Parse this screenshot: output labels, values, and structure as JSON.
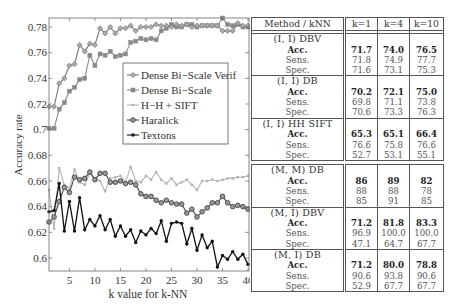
{
  "chart_data": {
    "type": "line",
    "title": "",
    "xlabel": "k value for k-NN",
    "ylabel": "Accuracy rate",
    "xlim": [
      1,
      40
    ],
    "ylim": [
      0.594,
      0.786
    ],
    "xticks": [
      5,
      10,
      15,
      20,
      25,
      30,
      35,
      40
    ],
    "yticks": [
      0.6,
      0.62,
      0.64,
      0.66,
      0.68,
      0.7,
      0.72,
      0.74,
      0.76,
      0.78
    ],
    "ytick_labels": [
      "0.6",
      "0.62",
      "0.64",
      "0.66",
      "0.68",
      "0.7",
      "0.72",
      "0.74",
      "0.76",
      "0.78"
    ],
    "grid": false,
    "legend_position": "inside, upper-middle",
    "x": [
      1,
      2,
      3,
      4,
      5,
      6,
      7,
      8,
      9,
      10,
      11,
      12,
      13,
      14,
      15,
      16,
      17,
      18,
      19,
      20,
      21,
      22,
      23,
      24,
      25,
      26,
      27,
      28,
      29,
      30,
      31,
      32,
      33,
      34,
      35,
      36,
      37,
      38,
      39,
      40
    ],
    "series": [
      {
        "name": "Dense Bi-Scale Verif",
        "color": "#777777",
        "marker": "diamond",
        "values": [
          0.718,
          0.718,
          0.736,
          0.74,
          0.75,
          0.751,
          0.766,
          0.761,
          0.767,
          0.766,
          0.779,
          0.775,
          0.78,
          0.775,
          0.779,
          0.779,
          0.781,
          0.777,
          0.78,
          0.78,
          0.78,
          0.782,
          0.781,
          0.781,
          0.78,
          0.782,
          0.781,
          0.782,
          0.78,
          0.781,
          0.781,
          0.781,
          0.781,
          0.781,
          0.777,
          0.777,
          0.777,
          0.783,
          0.781,
          0.781
        ]
      },
      {
        "name": "Dense Bi-Scale",
        "color": "#8a8a8a",
        "marker": "square",
        "values": [
          0.701,
          0.701,
          0.716,
          0.721,
          0.73,
          0.733,
          0.739,
          0.74,
          0.758,
          0.75,
          0.759,
          0.758,
          0.761,
          0.757,
          0.758,
          0.759,
          0.768,
          0.769,
          0.771,
          0.77,
          0.771,
          0.77,
          0.777,
          0.779,
          0.782,
          0.78,
          0.78,
          0.782,
          0.782,
          0.78,
          0.781,
          0.781,
          0.781,
          0.781,
          0.787,
          0.782,
          0.781,
          0.782,
          0.78,
          0.78
        ]
      },
      {
        "name": "H-H + SIFT",
        "color": "#b3b3b3",
        "marker": "small-square",
        "values": [
          0.653,
          0.623,
          0.67,
          0.657,
          0.654,
          0.669,
          0.659,
          0.657,
          0.666,
          0.662,
          0.66,
          0.652,
          0.662,
          0.663,
          0.664,
          0.659,
          0.671,
          0.66,
          0.659,
          0.664,
          0.661,
          0.667,
          0.661,
          0.658,
          0.662,
          0.657,
          0.659,
          0.661,
          0.657,
          0.653,
          0.66,
          0.66,
          0.661,
          0.66,
          0.661,
          0.662,
          0.662,
          0.663,
          0.663,
          0.664
        ]
      },
      {
        "name": "Haralick",
        "color": "#444444",
        "marker": "circle",
        "values": [
          0.628,
          0.632,
          0.644,
          0.655,
          0.651,
          0.663,
          0.661,
          0.662,
          0.667,
          0.661,
          0.666,
          0.666,
          0.659,
          0.659,
          0.66,
          0.658,
          0.659,
          0.657,
          0.65,
          0.648,
          0.648,
          0.645,
          0.643,
          0.645,
          0.643,
          0.642,
          0.642,
          0.635,
          0.638,
          0.632,
          0.636,
          0.639,
          0.643,
          0.643,
          0.648,
          0.643,
          0.64,
          0.641,
          0.64,
          0.638
        ]
      },
      {
        "name": "Textons",
        "color": "#111111",
        "marker": "dot",
        "values": [
          0.636,
          0.637,
          0.658,
          0.621,
          0.644,
          0.621,
          0.647,
          0.622,
          0.63,
          0.625,
          0.633,
          0.622,
          0.63,
          0.617,
          0.625,
          0.617,
          0.622,
          0.612,
          0.621,
          0.618,
          0.623,
          0.619,
          0.629,
          0.613,
          0.627,
          0.628,
          0.627,
          0.611,
          0.623,
          0.606,
          0.618,
          0.608,
          0.613,
          0.593,
          0.602,
          0.599,
          0.605,
          0.599,
          0.603,
          0.595
        ]
      }
    ]
  },
  "table": {
    "headers": [
      "Method / kNN",
      "k=1",
      "k=4",
      "k=10"
    ],
    "blocks": [
      {
        "groups": [
          {
            "title": "(I, I) DBV",
            "rows": [
              {
                "label": "Acc.",
                "values": [
                  "71.7",
                  "74.0",
                  "76.5"
                ]
              },
              {
                "label": "Sens.",
                "values": [
                  "71.8",
                  "74.9",
                  "77.7"
                ]
              },
              {
                "label": "Spec.",
                "values": [
                  "71.6",
                  "73.1",
                  "75.3"
                ]
              }
            ]
          },
          {
            "title": "(I, I) DB",
            "rows": [
              {
                "label": "Acc.",
                "values": [
                  "70.2",
                  "72.1",
                  "75.0"
                ]
              },
              {
                "label": "Sens.",
                "values": [
                  "69.8",
                  "71.1",
                  "73.8"
                ]
              },
              {
                "label": "Spec.",
                "values": [
                  "70.6",
                  "73.3",
                  "76.3"
                ]
              }
            ]
          },
          {
            "title": "(I, I) HH SIFT",
            "rows": [
              {
                "label": "Acc.",
                "values": [
                  "65.3",
                  "65.1",
                  "66.4"
                ]
              },
              {
                "label": "Sens.",
                "values": [
                  "76.6",
                  "75.8",
                  "76.6"
                ]
              },
              {
                "label": "Spec.",
                "values": [
                  "52.7",
                  "53.1",
                  "55.1"
                ]
              }
            ]
          }
        ]
      },
      {
        "groups": [
          {
            "title": "(M, M) DB",
            "rows": [
              {
                "label": "Acc.",
                "values": [
                  "86",
                  "89",
                  "82"
                ]
              },
              {
                "label": "Sens.",
                "values": [
                  "88",
                  "88",
                  "78"
                ]
              },
              {
                "label": "Spec.",
                "values": [
                  "85",
                  "91",
                  "85"
                ]
              }
            ]
          },
          {
            "title": "(M, I) DBV",
            "rows": [
              {
                "label": "Acc.",
                "values": [
                  "71.2",
                  "81.8",
                  "83.3"
                ]
              },
              {
                "label": "Sens.",
                "values": [
                  "96.9",
                  "100.0",
                  "100.0"
                ]
              },
              {
                "label": "Spec.",
                "values": [
                  "47.1",
                  "64.7",
                  "67.7"
                ]
              }
            ]
          },
          {
            "title": "(M, I) DB",
            "rows": [
              {
                "label": "Acc.",
                "values": [
                  "71.2",
                  "80.0",
                  "78.8"
                ]
              },
              {
                "label": "Sens.",
                "values": [
                  "90.6",
                  "93.8",
                  "90.6"
                ]
              },
              {
                "label": "Spec.",
                "values": [
                  "52.9",
                  "67.7",
                  "67.7"
                ]
              }
            ]
          }
        ]
      }
    ]
  }
}
